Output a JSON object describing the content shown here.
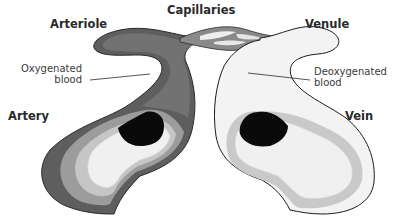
{
  "diagram": {
    "title_labels": {
      "capillaries": "Capillaries",
      "arteriole": "Arteriole",
      "venule": "Venule",
      "artery": "Artery",
      "vein": "Vein"
    },
    "annotations": {
      "oxygenated_line1": "Oxygenated",
      "oxygenated_line2": "blood",
      "deoxygenated_line1": "Deoxygenated",
      "deoxygenated_line2": "blood"
    },
    "colors": {
      "oxygenated_fill": "#6e6e6e",
      "artery_outer": "#5a5a5a",
      "artery_middle": "#9a9a9a",
      "artery_inner_ring": "#c4c4c4",
      "lumen": "#f2f2f2",
      "deoxygenated_fill": "#ececec",
      "vein_outer": "#f4f4f4",
      "vein_middle": "#c8c8c8",
      "blood_cell": "#0a0a0a",
      "outline": "#1c1c1c"
    }
  }
}
